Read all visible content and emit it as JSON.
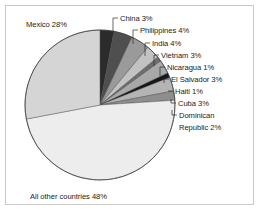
{
  "figure": {
    "background_color": "#ffffff",
    "border_color": "#c9c9c9",
    "text_color": "#1b1b1b",
    "leader_color": "#2a2a2a"
  },
  "labels": {
    "mexico": "Mexico 28%",
    "china": "China 3%",
    "philippines": "Philippines 4%",
    "india": "India 4%",
    "vietnam": "Vietnam 3%",
    "nicaragua": "Nicaragua 1%",
    "el_salvador": "El Salvador 3%",
    "haiti": "Haiti 1%",
    "cuba": "Cuba 3%",
    "dominican_republic_line1": "Dominican",
    "dominican_republic_line2": "Republic 2%",
    "all_other": "All other countries 48%"
  },
  "chart_data": {
    "type": "pie",
    "title": "",
    "xlabel": "",
    "ylabel": "",
    "legend_position": "none",
    "grid": false,
    "units": "percent",
    "start_angle_deg": 0,
    "direction": "clockwise",
    "categories": [
      "China",
      "Philippines",
      "India",
      "Vietnam",
      "Nicaragua",
      "El Salvador",
      "Haiti",
      "Cuba",
      "Dominican Republic",
      "All other countries",
      "Mexico"
    ],
    "values": [
      3,
      4,
      4,
      3,
      1,
      3,
      1,
      3,
      2,
      48,
      28
    ],
    "colors": [
      "#2b2b2b",
      "#4f4f4f",
      "#9a9a9a",
      "#c2c2c2",
      "#6e6e6e",
      "#a8a8a8",
      "#161616",
      "#b4b4b4",
      "#8e8e8e",
      "#ededed",
      "#d5d5d5"
    ],
    "labels": [
      "China 3%",
      "Philippines 4%",
      "India 4%",
      "Vietnam 3%",
      "Nicaragua 1%",
      "El Salvador 3%",
      "Haiti 1%",
      "Cuba 3%",
      "Dominican Republic 2%",
      "All other countries 48%",
      "Mexico 28%"
    ],
    "total": 100
  }
}
